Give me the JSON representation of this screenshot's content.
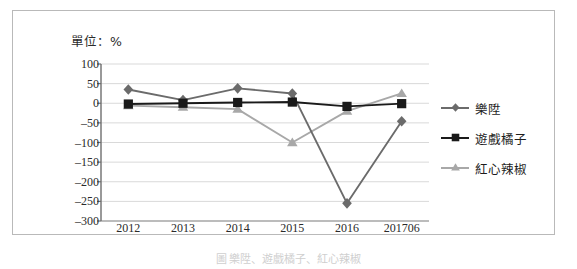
{
  "figure": {
    "unit_label": "單位：%",
    "caption": "圖 樂陞、遊戲橘子、紅心辣椒"
  },
  "chart_data": {
    "type": "line",
    "title": "",
    "xlabel": "",
    "ylabel": "",
    "unit": "%",
    "categories": [
      "2012",
      "2013",
      "2014",
      "2015",
      "2016",
      "201706"
    ],
    "yticks": [
      "100",
      "50",
      "0",
      "-50",
      "-100",
      "-150",
      "-200",
      "-250",
      "-300"
    ],
    "ytick_values": [
      100,
      50,
      0,
      -50,
      -100,
      -150,
      -200,
      -250,
      -300
    ],
    "ylim": [
      -300,
      100
    ],
    "grid": true,
    "legend_position": "right",
    "series": [
      {
        "name": "樂陞",
        "marker": "diamond",
        "color": "#6b6b6b",
        "values": [
          35,
          8,
          38,
          25,
          -255,
          -46
        ]
      },
      {
        "name": "遊戲橘子",
        "marker": "square",
        "color": "#1a1a1a",
        "values": [
          -2,
          0,
          2,
          3,
          -8,
          -1
        ]
      },
      {
        "name": "紅心辣椒",
        "marker": "triangle",
        "color": "#a8a8a8",
        "values": [
          -6,
          -10,
          -15,
          -100,
          -20,
          25
        ]
      }
    ]
  },
  "colors": {
    "frame": "#b9b9b9",
    "axis": "#7a7a7a",
    "grid": "#d9d9d9",
    "background": "#ffffff"
  }
}
